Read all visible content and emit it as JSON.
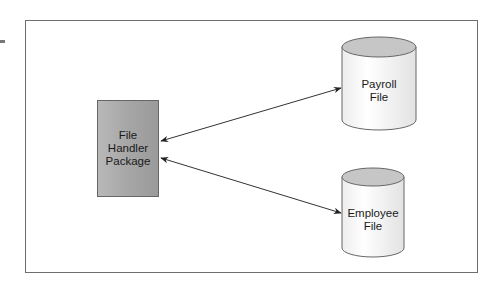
{
  "diagram": {
    "type": "data-flow",
    "frame": {
      "stroke": "#6e6e6e"
    },
    "nodes": [
      {
        "id": "file-handler",
        "shape": "rectangle",
        "lines": [
          "File",
          "Handler",
          "Package"
        ],
        "fill": "#a9a9a9"
      },
      {
        "id": "payroll-file",
        "shape": "cylinder",
        "lines": [
          "Payroll",
          "File"
        ],
        "top_fill": "#c8c8c8"
      },
      {
        "id": "employee-file",
        "shape": "cylinder",
        "lines": [
          "Employee",
          "File"
        ],
        "top_fill": "#c8c8c8"
      }
    ],
    "edges": [
      {
        "from": "file-handler",
        "to": "payroll-file",
        "direction": "bidirectional"
      },
      {
        "from": "file-handler",
        "to": "employee-file",
        "direction": "bidirectional"
      }
    ]
  }
}
